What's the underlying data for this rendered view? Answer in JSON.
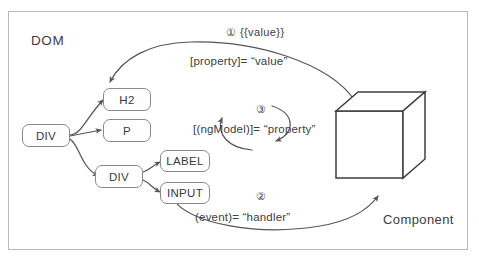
{
  "diagram": {
    "title_dom": "DOM",
    "title_component": "Component",
    "dom_nodes": [
      {
        "id": "root-div",
        "label": "DIV"
      },
      {
        "id": "h2",
        "label": "H2"
      },
      {
        "id": "p",
        "label": "P"
      },
      {
        "id": "child-div",
        "label": "DIV"
      },
      {
        "id": "label",
        "label": "LABEL"
      },
      {
        "id": "input",
        "label": "INPUT"
      }
    ],
    "bindings": [
      {
        "id": "interpolation-property",
        "marker": "①",
        "marker_text": "{{value}}",
        "expression": "[property]= “value”",
        "direction": "component-to-dom"
      },
      {
        "id": "two-way-ngmodel",
        "marker": "③",
        "marker_text": "",
        "expression": "[(ngModel)]= “property”",
        "direction": "bidirectional"
      },
      {
        "id": "event-handler",
        "marker": "②",
        "marker_text": "",
        "expression": "(event)= “handler”",
        "direction": "dom-to-component"
      }
    ],
    "component_shape": "cube",
    "colors": {
      "stroke": "#555555",
      "node_border": "#8a8a8a",
      "frame_border": "#b9b9b9",
      "text": "#3d3d3d",
      "background": "#ffffff"
    }
  }
}
